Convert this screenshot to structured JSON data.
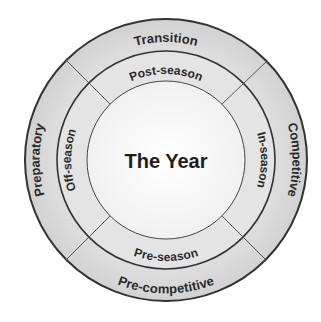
{
  "diagram": {
    "center_label": "The Year",
    "outer_ring": {
      "top": "Transition",
      "right": "Competitive",
      "bottom": "Pre-competitive",
      "left": "Preparatory"
    },
    "inner_ring": {
      "top": "Post-season",
      "right": "In-season",
      "bottom": "Pre-season",
      "left": "Off-season"
    },
    "colors": {
      "outer_ring_fill": "#d9d9d9",
      "inner_ring_fill": "#e3e3e3",
      "center_fill": "#fafafa",
      "line": "#333333",
      "text": "#2a2a2a"
    }
  }
}
